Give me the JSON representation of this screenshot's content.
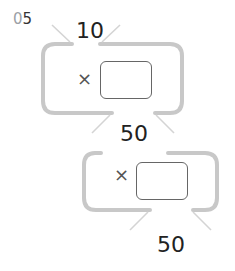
{
  "question": {
    "number_prefix": "0",
    "number": "5"
  },
  "problem1": {
    "top_value": "10",
    "operator": "×",
    "answer": "",
    "bottom_value": "50"
  },
  "problem2": {
    "operator": "×",
    "answer": "",
    "bottom_value": "50"
  },
  "colors": {
    "frame": "#c8c8c8",
    "text": "#222222",
    "number_prefix": "#9aa0a6"
  }
}
